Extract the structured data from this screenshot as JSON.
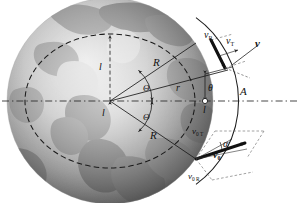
{
  "figure": {
    "type": "orbital-mechanics-diagram",
    "background_body": "earth-globe-grayscale",
    "colors": {
      "ink": "#111111",
      "axis_dash": "#333333",
      "orbit_dash": "#222222",
      "globe_dark": "#4a4a4a",
      "globe_light": "#d8d8d8",
      "ocean": "#8e8e8e",
      "land": "#c9c9c9"
    }
  },
  "labels": {
    "l_upper": "l",
    "l_lower": "l",
    "l_axis": "l",
    "R_upper": "R",
    "R_lower": "R",
    "r": "r",
    "Theta_upper": "Θ",
    "Theta_lower": "Θ",
    "theta": "θ",
    "A": "A",
    "alpha": "α",
    "v": "v",
    "v_R_base": "v",
    "v_R_sub": "R",
    "v_T_base": "v",
    "v_T_sub": "T",
    "v0_base": "v",
    "v0_sub": "0",
    "v0T_base": "v",
    "v0T_sub": "0 T",
    "v0R_base": "v",
    "v0R_sub": "0 R"
  },
  "geometry": {
    "center": {
      "x": 110,
      "y": 101
    },
    "circle_radius": 103,
    "ellipse_rx": 85,
    "ellipse_ry": 67,
    "point_A": {
      "x": 213,
      "y": 101
    },
    "apogee_point": {
      "x": 196,
      "y": 43
    },
    "perigee_point": {
      "x": 196,
      "y": 159
    },
    "axis_y": 101
  }
}
